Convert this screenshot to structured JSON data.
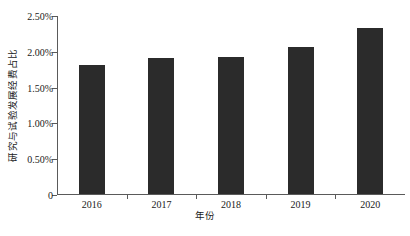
{
  "chart_data": {
    "type": "bar",
    "title": "",
    "subtitle": "",
    "categories": [
      "2016",
      "2017",
      "2018",
      "2019",
      "2020"
    ],
    "values": [
      1.8,
      1.9,
      1.91,
      2.05,
      2.32
    ],
    "series": [
      {
        "name": "研究与试验发展经费占比",
        "values": [
          1.8,
          1.9,
          1.91,
          2.05,
          2.32
        ]
      }
    ],
    "xlabel": "年份",
    "ylabel": "研究与试验发展经费占比",
    "ylim": [
      0,
      2.5
    ],
    "ytick_values": [
      0,
      0.5,
      1.0,
      1.5,
      2.0,
      2.5
    ],
    "ytick_labels": [
      "0",
      "0.50%",
      "1.00%",
      "1.50%",
      "2.00%",
      "2.50%"
    ],
    "xtick_labels": [
      "2016",
      "2017",
      "2018",
      "2019",
      "2020"
    ],
    "grid": false,
    "legend": false,
    "legend_position": "none",
    "bar_color": "#2b2b2b",
    "axis_color": "#5a5a5a",
    "background_color": "#ffffff",
    "value_unit": "%"
  }
}
